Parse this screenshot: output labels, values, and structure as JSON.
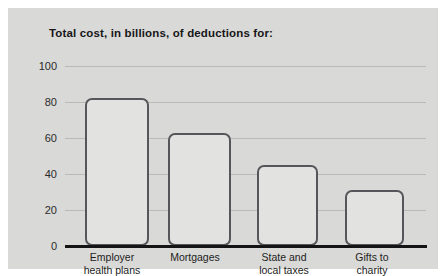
{
  "chart_data": {
    "type": "bar",
    "title": "Total cost, in billions, of deductions for:",
    "xlabel": "",
    "ylabel": "",
    "ylim": [
      0,
      100
    ],
    "yticks": [
      0,
      20,
      40,
      60,
      80,
      100
    ],
    "ytick_labels": [
      "0",
      "20",
      "40",
      "60",
      "80",
      "100"
    ],
    "grid": true,
    "legend": false,
    "categories": [
      "Employer\nhealth plans",
      "Mortgages",
      "State and\nlocal taxes",
      "Gifts to\ncharity"
    ],
    "values": [
      82,
      63,
      45,
      31
    ],
    "units": "billions of dollars"
  },
  "style": {
    "page_background": "#ffffff",
    "panel_background": "#d9d9d7",
    "bar_fill": "#e2e2e0",
    "bar_outline": "#55565a",
    "gridline_color": "#b9b9b7",
    "axis_color": "#141414",
    "title_color": "#171717",
    "label_color": "#1d1d1d"
  }
}
